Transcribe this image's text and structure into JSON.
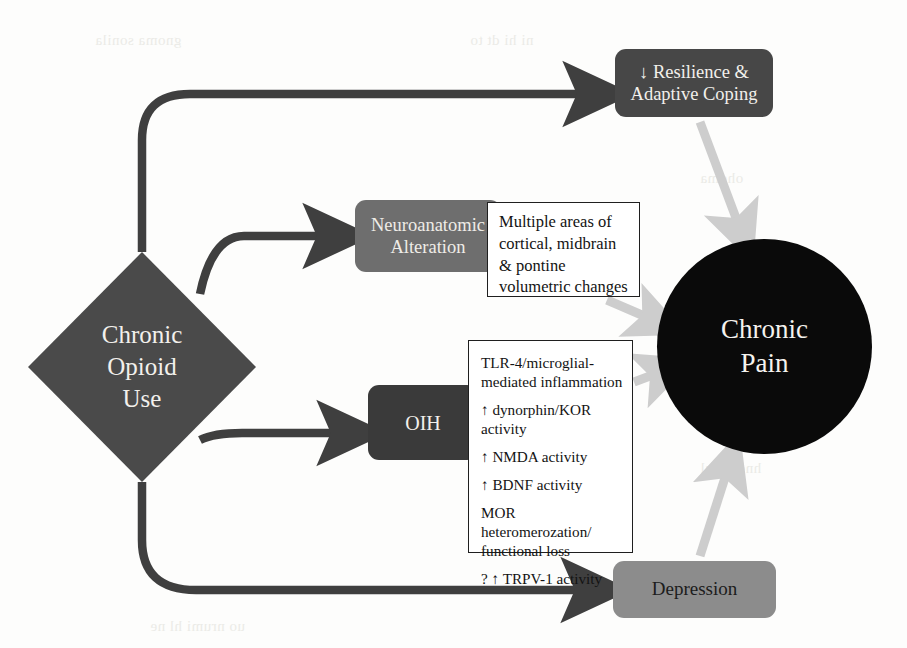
{
  "diagram": {
    "nodes": {
      "chronic_opioid_use": {
        "label": "Chronic\nOpioid\nUse",
        "shape": "diamond",
        "color": "#4a4a4a"
      },
      "resilience": {
        "label": "↓ Resilience &\nAdaptive Coping",
        "shape": "rounded-box",
        "color": "#474747"
      },
      "neuroanatomic": {
        "label": "Neuroanatomic\nAlteration",
        "shape": "rounded-box",
        "color": "#6e6e6e"
      },
      "oih": {
        "label": "OIH",
        "shape": "rounded-box",
        "color": "#3a3a3a"
      },
      "depression": {
        "label": "Depression",
        "shape": "rounded-box",
        "color": "#8c8c8c"
      },
      "chronic_pain": {
        "label": "Chronic\nPain",
        "shape": "circle",
        "color": "#0a0a0a"
      }
    },
    "detail_boxes": {
      "neuroanatomic_detail": {
        "text": "Multiple areas of cortical, midbrain & pontine volumetric changes"
      },
      "oih_detail": {
        "items": [
          "TLR-4/microglial-\nmediated inflammation",
          "↑ dynorphin/KOR activity",
          "↑ NMDA activity",
          "↑ BDNF activity",
          "MOR heteromerozation/\nfunctional loss",
          "? ↑ TRPV-1 activity"
        ]
      }
    },
    "edges": [
      {
        "from": "chronic_opioid_use",
        "to": "resilience",
        "style": "dark-arrow"
      },
      {
        "from": "chronic_opioid_use",
        "to": "neuroanatomic",
        "style": "dark-arrow"
      },
      {
        "from": "chronic_opioid_use",
        "to": "oih",
        "style": "dark-arrow"
      },
      {
        "from": "chronic_opioid_use",
        "to": "depression",
        "style": "dark-arrow"
      },
      {
        "from": "resilience",
        "to": "chronic_pain",
        "style": "light-arrow"
      },
      {
        "from": "neuroanatomic_detail",
        "to": "chronic_pain",
        "style": "light-arrow"
      },
      {
        "from": "oih_detail",
        "to": "chronic_pain",
        "style": "light-arrow"
      },
      {
        "from": "depression",
        "to": "chronic_pain",
        "style": "light-arrow"
      }
    ],
    "colors": {
      "dark_connector": "#3f3f3f",
      "light_connector": "#cdcdcd",
      "page_background": "#fdfdfc"
    }
  }
}
